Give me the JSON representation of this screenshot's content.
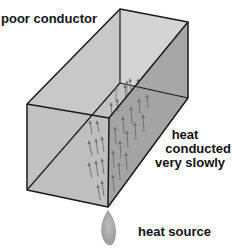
{
  "diagram": {
    "labels": {
      "material": "poor conductor",
      "conduction_line1": "heat",
      "conduction_line2": "conducted",
      "conduction_line3": "very slowly",
      "source": "heat source"
    },
    "colors": {
      "outline": "#1a1a1a",
      "face_front": "#bdbdbd",
      "face_side": "#a6a6a6",
      "face_back": "#cfcfcf",
      "arrows": "#6e6e6e",
      "flame": "#a9a9a9",
      "text": "#111111"
    }
  }
}
